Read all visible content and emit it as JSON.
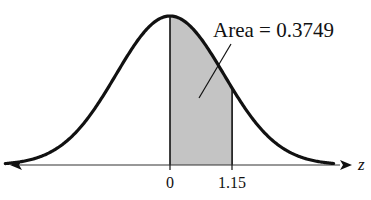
{
  "diagram": {
    "type": "standard-normal-curve",
    "annotation": "Area = 0.3749",
    "axis_label": "z",
    "ticks": [
      {
        "value": 0,
        "label": "0"
      },
      {
        "value": 1.15,
        "label": "1.15"
      }
    ],
    "shaded_region": {
      "from": 0,
      "to": 1.15,
      "area": 0.3749
    },
    "colors": {
      "curve": "#111111",
      "shade": "#c4c4c4",
      "axis": "#222222"
    }
  }
}
